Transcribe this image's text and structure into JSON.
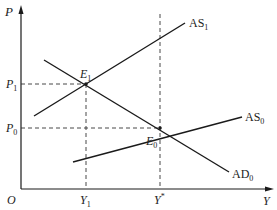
{
  "diagram": {
    "type": "AS-AD model",
    "axes": {
      "y_label": "P",
      "x_label": "Y",
      "origin_label": "O"
    },
    "curves": [
      {
        "id": "AS1",
        "label": "AS",
        "subscript": "1",
        "kind": "aggregate-supply"
      },
      {
        "id": "AS0",
        "label": "AS",
        "subscript": "0",
        "kind": "aggregate-supply"
      },
      {
        "id": "AD0",
        "label": "AD",
        "subscript": "0",
        "kind": "aggregate-demand"
      }
    ],
    "equilibria": [
      {
        "id": "E1",
        "label": "E",
        "subscript": "1",
        "price": "P1",
        "output": "Y1"
      },
      {
        "id": "E0",
        "label": "E",
        "subscript": "0",
        "price": "P0",
        "output": "Y*"
      }
    ],
    "y_ticks": [
      {
        "label": "P",
        "subscript": "1"
      },
      {
        "label": "P",
        "subscript": "0"
      }
    ],
    "x_ticks": [
      {
        "label": "Y",
        "subscript": "1"
      },
      {
        "label": "Y",
        "superscript": "*"
      }
    ]
  },
  "colors": {
    "line": "#1a1a1a",
    "dash": "#333333",
    "background": "#ffffff"
  }
}
